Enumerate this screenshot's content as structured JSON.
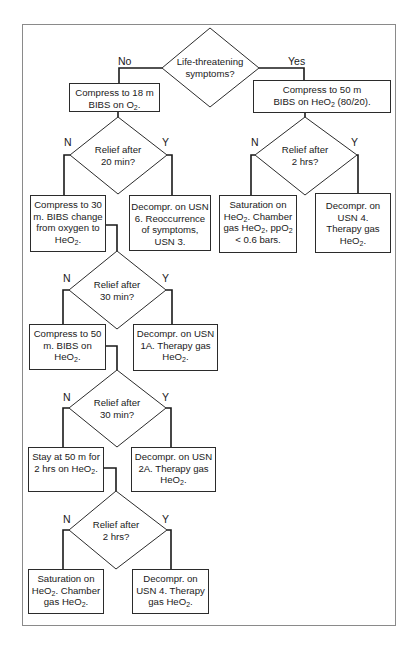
{
  "diagram": {
    "type": "flowchart",
    "decisions": {
      "d1": {
        "line1": "Life-threatening",
        "line2": "symptoms?",
        "no_label": "No",
        "yes_label": "Yes"
      },
      "d2": {
        "line1": "Relief after",
        "line2": "20 min?",
        "no_label": "N",
        "yes_label": "Y"
      },
      "d3": {
        "line1": "Relief after",
        "line2": "30 min?",
        "no_label": "N",
        "yes_label": "Y"
      },
      "d4": {
        "line1": "Relief after",
        "line2": "30 min?",
        "no_label": "N",
        "yes_label": "Y"
      },
      "d5": {
        "line1": "Relief after",
        "line2": "2 hrs?",
        "no_label": "N",
        "yes_label": "Y"
      },
      "dR": {
        "line1": "Relief after",
        "line2": "2 hrs?",
        "no_label": "N",
        "yes_label": "Y"
      }
    },
    "boxes": {
      "b_no_18m": {
        "l1": "Compress to 18 m",
        "l2a": "BIBS on O",
        "l2sub": "2",
        "l2b": "."
      },
      "b_yes_50m": {
        "l1": "Compress to 50 m",
        "l2a": "BIBS on HeO",
        "l2sub": "2",
        "l2b": " (80/20)."
      },
      "b_30m": {
        "l1": "Compress to 30",
        "l2": "m. BIBS change",
        "l3": "from oxygen to",
        "l4a": "HeO",
        "l4sub": "2",
        "l4b": "."
      },
      "b_usn6": {
        "l1": "Decompr. on USN",
        "l2": "6. Reoccurrence",
        "l3": "of symptoms,",
        "l4": "USN 3."
      },
      "b_sat_right": {
        "l1": "Saturation on",
        "l2a": "HeO",
        "l2sub": "2",
        "l2b": ". Chamber",
        "l3a": "gas HeO",
        "l3sub": "2",
        "l3b": ", ppO",
        "l3sub2": "2",
        "l4": "< 0.6 bars."
      },
      "b_usn4_right": {
        "l1": "Decompr. on",
        "l2": "USN 4.",
        "l3": "Therapy gas",
        "l4a": "HeO",
        "l4sub": "2",
        "l4b": "."
      },
      "b_50m": {
        "l1": "Compress to 50",
        "l2": "m. BIBS on",
        "l3a": "HeO",
        "l3sub": "2",
        "l3b": "."
      },
      "b_usn1a": {
        "l1": "Decompr. on USN",
        "l2": "1A. Therapy gas",
        "l3a": "HeO",
        "l3sub": "2",
        "l3b": "."
      },
      "b_stay": {
        "l1": "Stay at 50 m for",
        "l2a": "2 hrs on HeO",
        "l2sub": "2",
        "l2b": "."
      },
      "b_usn2a": {
        "l1": "Decompr. on USN",
        "l2": "2A. Therapy gas",
        "l3a": "HeO",
        "l3sub": "2",
        "l3b": "."
      },
      "b_sat_bottom": {
        "l1": "Saturation on",
        "l2a": "HeO",
        "l2sub": "2",
        "l2b": ". Chamber",
        "l3a": "gas HeO",
        "l3sub": "2",
        "l3b": "."
      },
      "b_usn4_bottom": {
        "l1": "Decompr. on",
        "l2": "USN 4. Therapy",
        "l3a": "gas HeO",
        "l3sub": "2",
        "l3b": "."
      }
    }
  }
}
